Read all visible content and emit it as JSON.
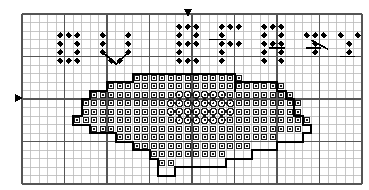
{
  "document": {
    "title": "Cross-Stitch Pattern Chart",
    "kind": "counted-cross-stitch-grid-chart",
    "background_color": "#ffffff"
  },
  "grid": {
    "origin_x": 22,
    "origin_y": 14,
    "cell_size": 8.5,
    "cols": 40,
    "rows": 20,
    "minor_line_color": "#b9b9b9",
    "major_line_color": "#555555",
    "minor_line_width": 0.8,
    "major_line_width": 1.6,
    "major_every": 5
  },
  "symbols": {
    "diamond": {
      "name": "filled-diamond",
      "color": "#000000",
      "description": "solid black diamond stitch marker"
    },
    "square": {
      "name": "open-square-dot",
      "color": "#1a1a1a",
      "description": "small open square with centre dot"
    },
    "circle": {
      "name": "open-circle-dot",
      "color": "#1a1a1a",
      "description": "open circle with centre dot"
    }
  },
  "markers": {
    "top_center": {
      "name": "center-marker-down",
      "glyph": "down-triangle",
      "x": 188,
      "y": 13,
      "color": "#000000"
    },
    "left_center": {
      "name": "center-marker-right",
      "glyph": "right-triangle",
      "x": 18,
      "y": 98,
      "color": "#000000"
    }
  },
  "backstitch": {
    "color": "#000000",
    "width": 2.0,
    "letter_stroke_width": 1.6
  },
  "chart_data": {
    "type": "heatmap",
    "title": "Cross-Stitch Pattern Chart",
    "xlabel": "",
    "ylabel": "",
    "grid": true,
    "legend": "none",
    "cols": 40,
    "rows": 20,
    "cell_symbols": {
      "diamond_cells": [
        [
          19,
          2
        ],
        [
          20,
          2
        ],
        [
          21,
          2
        ],
        [
          24,
          2
        ],
        [
          25,
          2
        ],
        [
          26,
          2
        ],
        [
          29,
          2
        ],
        [
          30,
          2
        ],
        [
          31,
          2
        ],
        [
          5,
          3
        ],
        [
          6,
          3
        ],
        [
          7,
          3
        ],
        [
          10,
          3
        ],
        [
          13,
          3
        ],
        [
          19,
          3
        ],
        [
          21,
          3
        ],
        [
          24,
          3
        ],
        [
          29,
          3
        ],
        [
          31,
          3
        ],
        [
          34,
          3
        ],
        [
          35,
          3
        ],
        [
          36,
          3
        ],
        [
          38,
          3
        ],
        [
          40,
          3
        ],
        [
          5,
          4
        ],
        [
          7,
          4
        ],
        [
          10,
          4
        ],
        [
          13,
          4
        ],
        [
          19,
          4
        ],
        [
          20,
          4
        ],
        [
          21,
          4
        ],
        [
          24,
          4
        ],
        [
          25,
          4
        ],
        [
          26,
          4
        ],
        [
          29,
          4
        ],
        [
          30,
          4
        ],
        [
          31,
          4
        ],
        [
          35,
          4
        ],
        [
          39,
          4
        ],
        [
          5,
          5
        ],
        [
          7,
          5
        ],
        [
          10,
          5
        ],
        [
          13,
          5
        ],
        [
          19,
          5
        ],
        [
          24,
          5
        ],
        [
          29,
          5
        ],
        [
          31,
          5
        ],
        [
          35,
          5
        ],
        [
          39,
          5
        ],
        [
          5,
          6
        ],
        [
          6,
          6
        ],
        [
          7,
          6
        ],
        [
          11,
          6
        ],
        [
          12,
          6
        ],
        [
          19,
          6
        ],
        [
          20,
          6
        ],
        [
          21,
          6
        ],
        [
          24,
          6
        ],
        [
          29,
          6
        ],
        [
          31,
          6
        ]
      ],
      "circle_cells": [
        [
          19,
          10
        ],
        [
          20,
          10
        ],
        [
          21,
          10
        ],
        [
          22,
          10
        ],
        [
          23,
          10
        ],
        [
          24,
          10
        ],
        [
          18,
          11
        ],
        [
          19,
          11
        ],
        [
          20,
          11
        ],
        [
          21,
          11
        ],
        [
          22,
          11
        ],
        [
          23,
          11
        ],
        [
          24,
          11
        ],
        [
          25,
          11
        ],
        [
          18,
          12
        ],
        [
          19,
          12
        ],
        [
          20,
          12
        ],
        [
          21,
          12
        ],
        [
          22,
          12
        ],
        [
          23,
          12
        ],
        [
          24,
          12
        ],
        [
          25,
          12
        ],
        [
          19,
          13
        ],
        [
          20,
          13
        ],
        [
          21,
          13
        ],
        [
          22,
          13
        ],
        [
          23,
          13
        ],
        [
          24,
          13
        ]
      ]
    },
    "outline_note": "heavy black backstitch outline traces a stepped silhouette around the open-square symbol field"
  }
}
